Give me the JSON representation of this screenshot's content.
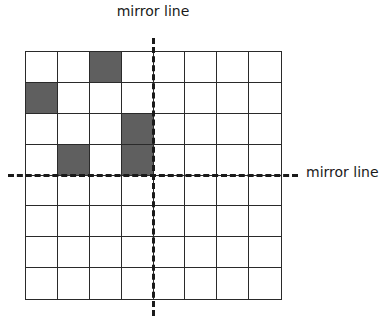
{
  "labels": {
    "vertical_mirror": "mirror line",
    "horizontal_mirror": "mirror line"
  },
  "grid": {
    "rows": 8,
    "cols": 8,
    "shaded_color": "#5f5f5f",
    "line_color": "#2a2a2a",
    "shaded_cells": [
      {
        "row": 0,
        "col": 2
      },
      {
        "row": 1,
        "col": 0
      },
      {
        "row": 2,
        "col": 3
      },
      {
        "row": 3,
        "col": 1
      },
      {
        "row": 3,
        "col": 3
      }
    ]
  },
  "mirror_lines": {
    "vertical": {
      "between_cols": [
        3,
        4
      ],
      "style": "dashed"
    },
    "horizontal": {
      "between_rows": [
        3,
        4
      ],
      "style": "dashed"
    }
  }
}
